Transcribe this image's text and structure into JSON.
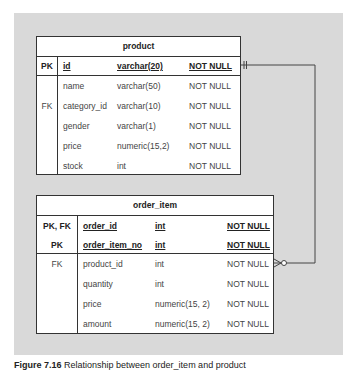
{
  "tables": {
    "product": {
      "title": "product",
      "pk_rows": [
        {
          "key": "PK",
          "name": "id",
          "type": "varchar(20)",
          "constraint": "NOT NULL"
        }
      ],
      "rows": [
        {
          "key": "",
          "name": "name",
          "type": "varchar(50)",
          "constraint": "NOT NULL"
        },
        {
          "key": "FK",
          "name": "category_id",
          "type": "varchar(10)",
          "constraint": "NOT NULL"
        },
        {
          "key": "",
          "name": "gender",
          "type": "varchar(1)",
          "constraint": "NOT NULL"
        },
        {
          "key": "",
          "name": "price",
          "type": "numeric(15,2)",
          "constraint": "NOT NULL"
        },
        {
          "key": "",
          "name": "stock",
          "type": "int",
          "constraint": "NOT NULL"
        }
      ]
    },
    "order_item": {
      "title": "order_item",
      "pk_rows": [
        {
          "key": "PK, FK",
          "name": "order_id",
          "type": "int",
          "constraint": "NOT NULL"
        },
        {
          "key": "PK",
          "name": "order_item_no",
          "type": "int",
          "constraint": "NOT NULL"
        }
      ],
      "rows": [
        {
          "key": "FK",
          "name": "product_id",
          "type": "int",
          "constraint": "NOT NULL"
        },
        {
          "key": "",
          "name": "quantity",
          "type": "int",
          "constraint": "NOT NULL"
        },
        {
          "key": "",
          "name": "price",
          "type": "numeric(15, 2)",
          "constraint": "NOT NULL"
        },
        {
          "key": "",
          "name": "amount",
          "type": "numeric(15, 2)",
          "constraint": "NOT NULL"
        }
      ]
    }
  },
  "relationship": {
    "from": "product.id",
    "to": "order_item.product_id",
    "product_end": "one-and-only-one",
    "order_item_end": "zero-or-many"
  },
  "caption": {
    "label": "Figure 7.16",
    "text": "Relationship between order_item and product"
  },
  "colors": {
    "panel": "#d9d9d9",
    "line": "#333333"
  }
}
